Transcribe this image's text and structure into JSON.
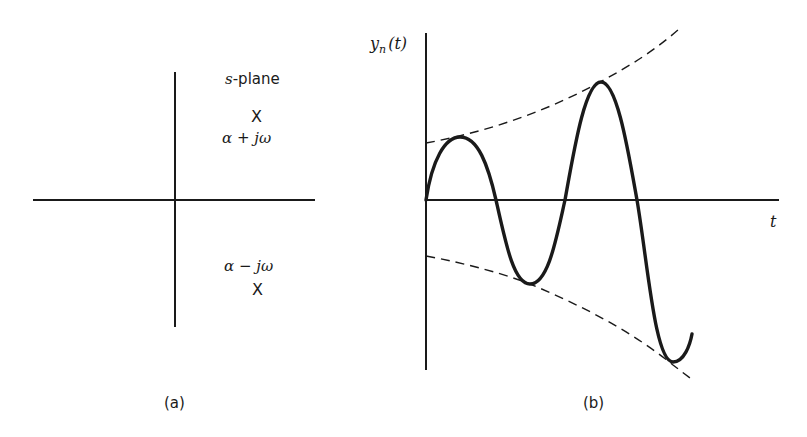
{
  "panel_a": {
    "caption": "(a)",
    "plane_label_var": "s",
    "plane_label_rest": "-plane",
    "pole_upper": {
      "marker": "X",
      "label_a": "α",
      "label_op": "+",
      "label_j": "jω"
    },
    "pole_lower": {
      "marker": "X",
      "label_a": "α",
      "label_op": "−",
      "label_j": "jω"
    }
  },
  "panel_b": {
    "caption": "(b)",
    "y_axis_label_y": "y",
    "y_axis_label_sub": "n",
    "y_axis_label_arg": "(t)",
    "x_axis_label": "t"
  },
  "colors": {
    "ink": "#1a1a1a",
    "background": "#ffffff"
  }
}
